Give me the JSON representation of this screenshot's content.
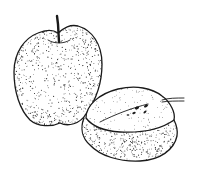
{
  "image": {
    "subject": "Stippled ink illustration of a whole apple and a halved apple",
    "width": 198,
    "height": 176,
    "background_color": "#ffffff",
    "ink_color": "#1a1a1a",
    "objects": [
      {
        "name": "whole-apple",
        "position": "upper-left",
        "features": [
          "stem",
          "stippled skin"
        ]
      },
      {
        "name": "halved-apple",
        "position": "lower-right",
        "features": [
          "cut face",
          "seeds",
          "stem",
          "stippled skin"
        ]
      }
    ]
  }
}
